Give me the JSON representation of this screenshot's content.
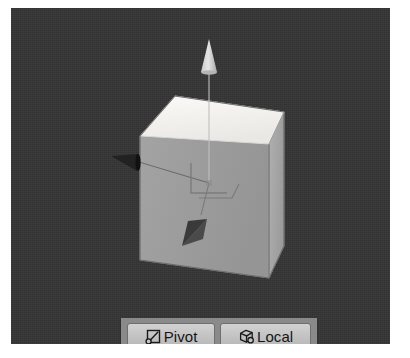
{
  "app": {
    "name": "Unity Scene View",
    "background_color": "#343434",
    "page_background": "#ffffff"
  },
  "scene": {
    "label": "scene-viewport",
    "background_color": "#343434",
    "objects": [
      {
        "name": "cube",
        "type": "mesh",
        "faces": {
          "top": {
            "name": "top-face",
            "color": "#f2f1ee"
          },
          "front": {
            "name": "front-face",
            "color": "#9d9d9d"
          },
          "right": {
            "name": "right-face",
            "color": "#a9a9a9"
          }
        },
        "outline_color": "#6b6b6b"
      },
      {
        "name": "move-gizmo",
        "type": "transform-gizmo",
        "mode": "move",
        "axes": [
          {
            "axis": "Y",
            "name": "gizmo-y-axis-arrow",
            "direction": "up",
            "color": "#d8d8d8",
            "line_color": "#bdbdbd"
          },
          {
            "axis": "X",
            "name": "gizmo-x-axis-arrow",
            "direction": "left",
            "color": "#1f1f1f",
            "line_color": "#2a2a2a"
          },
          {
            "axis": "Z",
            "name": "gizmo-z-axis-arrow",
            "direction": "front-left",
            "color": "#3a3a3a",
            "line_color": "#464646"
          }
        ],
        "plane_handle": {
          "name": "gizmo-plane-handle",
          "color": "#787878"
        },
        "center_color": "#7d7d7d"
      }
    ]
  },
  "toolbar": {
    "name": "scene-view-toolbar",
    "background_color": "#8a8a8a",
    "buttons": [
      {
        "id": "pivot",
        "label": "Pivot",
        "icon": "pivot-icon",
        "icon_description": "square outline with diagonal line and small circle at bottom-left",
        "state": "Pivot",
        "alternate_state": "Center"
      },
      {
        "id": "local",
        "label": "Local",
        "icon": "local-icon",
        "icon_description": "isometric cube outline with small circle at bottom-right",
        "state": "Local",
        "alternate_state": "Global"
      }
    ]
  }
}
